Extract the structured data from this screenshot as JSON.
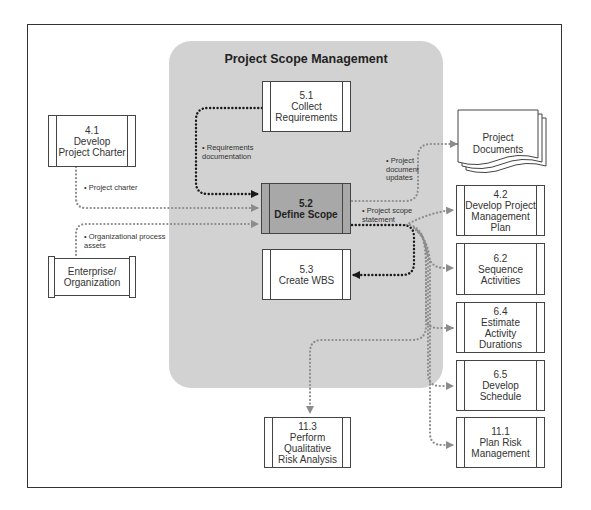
{
  "diagram": {
    "title": "Project Scope Management",
    "colors": {
      "scope_background": "#d2d2d2",
      "active_process": "#a8a8a8",
      "primary_flow": "#1a1a1a",
      "secondary_flow": "#8c8c8c"
    },
    "nodes": {
      "p41": {
        "number": "4.1",
        "label": "4.1\nDevelop\nProject Charter"
      },
      "ent": {
        "label": "Enterprise/\nOrganization"
      },
      "p51": {
        "number": "5.1",
        "label": "5.1\nCollect\nRequirements"
      },
      "p52": {
        "number": "5.2",
        "label": "5.2\nDefine Scope"
      },
      "p53": {
        "number": "5.3",
        "label": "5.3\nCreate WBS"
      },
      "docs": {
        "label": "Project\nDocuments"
      },
      "p42": {
        "number": "4.2",
        "label": "4.2\nDevelop Project\nManagement\nPlan"
      },
      "p62": {
        "number": "6.2",
        "label": "6.2\nSequence\nActivities"
      },
      "p64": {
        "number": "6.4",
        "label": "6.4\nEstimate Activity\nDurations"
      },
      "p65": {
        "number": "6.5",
        "label": "6.5\nDevelop\nSchedule"
      },
      "p111": {
        "number": "11.1",
        "label": "11.1\nPlan Risk\nManagement"
      },
      "p113": {
        "number": "11.3",
        "label": "11.3\nPerform\nQualitative\nRisk Analysis"
      }
    },
    "flow_labels": {
      "requirements_doc": "• Requirements\n  documentation",
      "project_charter": "• Project charter",
      "org_process_assets": "• Organizational process\n  assets",
      "doc_updates": "• Project\n  document\n  updates",
      "scope_statement": "• Project scope\n  statement"
    },
    "edges": [
      {
        "from": "5.1",
        "to": "5.2",
        "label": "Requirements documentation",
        "style": "primary"
      },
      {
        "from": "4.1",
        "to": "5.2",
        "label": "Project charter",
        "style": "secondary"
      },
      {
        "from": "Enterprise/Organization",
        "to": "5.2",
        "label": "Organizational process assets",
        "style": "secondary"
      },
      {
        "from": "5.2",
        "to": "Project Documents",
        "label": "Project document updates",
        "style": "secondary"
      },
      {
        "from": "5.2",
        "to": "5.3",
        "label": "Project scope statement",
        "style": "primary"
      },
      {
        "from": "5.2",
        "to": "4.2",
        "label": "Project scope statement",
        "style": "secondary"
      },
      {
        "from": "5.2",
        "to": "6.2",
        "label": "Project scope statement",
        "style": "secondary"
      },
      {
        "from": "5.2",
        "to": "6.4",
        "label": "Project scope statement",
        "style": "secondary"
      },
      {
        "from": "5.2",
        "to": "6.5",
        "label": "Project scope statement",
        "style": "secondary"
      },
      {
        "from": "5.2",
        "to": "11.1",
        "label": "Project scope statement",
        "style": "secondary"
      },
      {
        "from": "5.2",
        "to": "11.3",
        "label": "Project scope statement",
        "style": "secondary"
      }
    ]
  }
}
